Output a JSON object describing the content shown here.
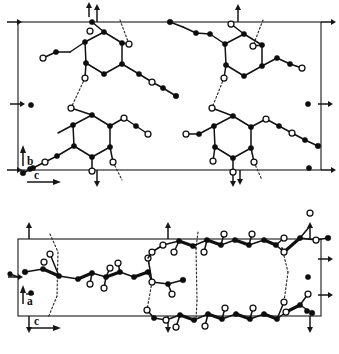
{
  "figure": {
    "name": "crystal-packing-diagram",
    "panels": [
      {
        "id": "upper",
        "name": "projection-along-a",
        "projection_axes": [
          "b",
          "c"
        ],
        "cell": {
          "x": 18,
          "y": 22,
          "width": 303,
          "height": 148
        },
        "vertical_axis": {
          "label": "b",
          "direction": "up"
        },
        "horizontal_axis": {
          "label": "c",
          "direction": "right"
        }
      },
      {
        "id": "lower",
        "name": "projection-along-b",
        "projection_axes": [
          "a",
          "c"
        ],
        "cell": {
          "x": 18,
          "y": 239,
          "width": 303,
          "height": 77
        },
        "vertical_axis": {
          "label": "a",
          "direction": "up",
          "overbar": true
        },
        "horizontal_axis": {
          "label": "c",
          "direction": "right"
        }
      }
    ],
    "legend": {
      "filled_circle": "carbon-atom",
      "open_circle": "oxygen-atom",
      "solid_line": "covalent-bond",
      "dotted_line": "hydrogen-bond",
      "small_arrow": "symmetry-axis-marker"
    },
    "axis_labels": {
      "b": "b",
      "c": "c",
      "a": "a"
    },
    "colors": {
      "ink": "#111111",
      "cell_outline": "#232323",
      "background": "#ffffff",
      "open_atom_fill": "#ffffff"
    }
  }
}
